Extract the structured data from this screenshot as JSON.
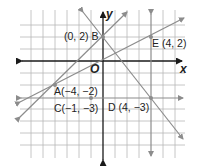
{
  "figure": {
    "type": "coordinate-plane",
    "axes": {
      "x_label": "x",
      "y_label": "y",
      "origin_label": "O"
    },
    "points": [
      {
        "name": "B",
        "coords": "(0, 2)",
        "label": "(0, 2) B"
      },
      {
        "name": "E",
        "coords": "(4, 2)",
        "label": "E (4, 2)"
      },
      {
        "name": "A",
        "coords": "(−4, −2)",
        "label": "A(−4, −2)"
      },
      {
        "name": "C",
        "coords": "(−1, −3)",
        "label": "C(−1, −3)"
      },
      {
        "name": "D",
        "coords": "(4, −3)",
        "label": "D (4, −3)"
      }
    ],
    "lines": [
      {
        "name": "line-AB",
        "through": [
          "A",
          "B"
        ],
        "slope": 1
      },
      {
        "name": "line-OE",
        "through": [
          "A",
          "O",
          "E"
        ],
        "slope": 0.5
      },
      {
        "name": "line-BD",
        "through": [
          "B",
          "D"
        ],
        "slope": -1.25
      },
      {
        "name": "line-CD",
        "through": [
          "C",
          "D"
        ],
        "equation": "y = -3"
      },
      {
        "name": "line-ED",
        "through": [
          "E",
          "D"
        ],
        "equation": "x = 4"
      }
    ],
    "colors": {
      "grid": "#b8b8b8",
      "axis": "#1a1a1a",
      "line": "#8c8c8c",
      "text": "#222222"
    }
  }
}
